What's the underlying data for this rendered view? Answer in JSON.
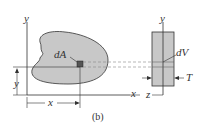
{
  "diagram": {
    "caption": "(b)",
    "left_view": {
      "axis_y": "y",
      "axis_x": "x",
      "element_label": "dA",
      "dim_y": "y",
      "dim_x": "x"
    },
    "right_view": {
      "axis_y": "y",
      "axis_z": "z",
      "element_label": "dV",
      "thickness_label": "T"
    },
    "colors": {
      "shape_fill": "#c8c8c8",
      "element_fill": "#555555",
      "line": "#333333",
      "dashed": "#888888"
    }
  }
}
